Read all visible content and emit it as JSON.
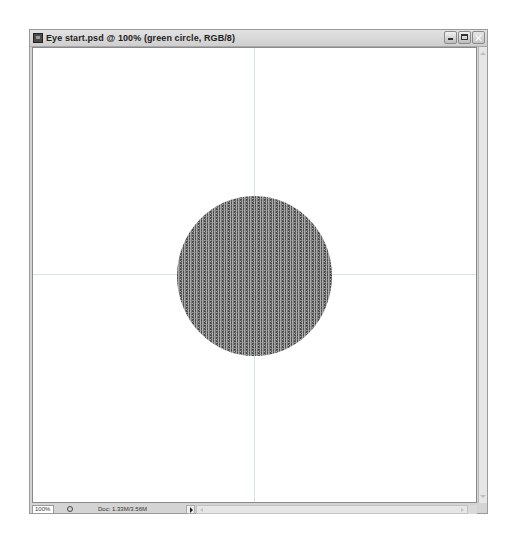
{
  "window": {
    "title": "Eye start.psd @ 100% (green circle, RGB/8)",
    "buttons": {
      "minimize": "minimize-icon",
      "maximize": "maximize-icon",
      "close": "close-icon"
    }
  },
  "canvas": {
    "background": "#ffffff",
    "guides": {
      "vertical": true,
      "horizontal": true,
      "color": "#d8e4e8"
    },
    "layer_shape": {
      "type": "circle",
      "fill": "#7b7b7b",
      "texture": "noise"
    }
  },
  "statusbar": {
    "zoom": "100%",
    "doc_info": "Doc: 1.33M/3.56M"
  }
}
